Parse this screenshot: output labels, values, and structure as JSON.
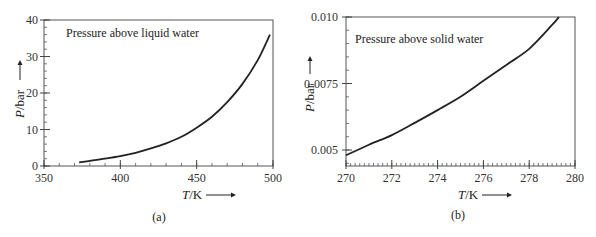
{
  "chart_data": [
    {
      "type": "line",
      "panel": "(a)",
      "title": "",
      "annotation": "Pressure above liquid water",
      "xlabel_italic": "T",
      "xlabel_unit": "/K",
      "ylabel_italic": "P",
      "ylabel_unit": "/bar",
      "xlim": [
        350,
        500
      ],
      "ylim": [
        0,
        40
      ],
      "xticks": [
        350,
        400,
        450,
        500
      ],
      "xtick_labels": [
        "350",
        "400",
        "450",
        "500"
      ],
      "yticks": [
        0,
        10,
        20,
        30,
        40
      ],
      "ytick_labels": [
        "0",
        "10",
        "20",
        "30",
        "40"
      ],
      "x_minor_step": 10,
      "y_minor_step": 2,
      "grid": false,
      "series": [
        {
          "name": "Pressure above liquid water",
          "x": [
            373,
            380,
            390,
            400,
            410,
            420,
            430,
            440,
            450,
            460,
            470,
            480,
            490,
            498
          ],
          "y": [
            1.0,
            1.4,
            2.0,
            2.7,
            3.6,
            4.8,
            6.2,
            8.0,
            10.5,
            13.5,
            17.5,
            22.5,
            29.0,
            36.0
          ]
        }
      ]
    },
    {
      "type": "line",
      "panel": "(b)",
      "title": "",
      "annotation": "Pressure above solid water",
      "xlabel_italic": "T",
      "xlabel_unit": "/K",
      "ylabel_italic": "P",
      "ylabel_unit": "/bar",
      "xlim": [
        270,
        280
      ],
      "ylim": [
        0.0044,
        0.01
      ],
      "xticks": [
        270,
        272,
        274,
        276,
        278,
        280
      ],
      "xtick_labels": [
        "270",
        "272",
        "274",
        "276",
        "278",
        "280"
      ],
      "yticks": [
        0.005,
        0.0075,
        0.01
      ],
      "ytick_labels": [
        "0.005",
        "0-0075",
        "0.010"
      ],
      "x_minor_step": 0.2,
      "y_minor_step": 0.0005,
      "grid": false,
      "series": [
        {
          "name": "Pressure above solid water",
          "x": [
            270,
            271,
            272,
            273,
            274,
            275,
            276,
            277,
            278,
            279,
            279.3
          ],
          "y": [
            0.0048,
            0.0052,
            0.00556,
            0.00602,
            0.0065,
            0.007,
            0.0076,
            0.0082,
            0.0088,
            0.0097,
            0.01
          ]
        }
      ]
    }
  ]
}
